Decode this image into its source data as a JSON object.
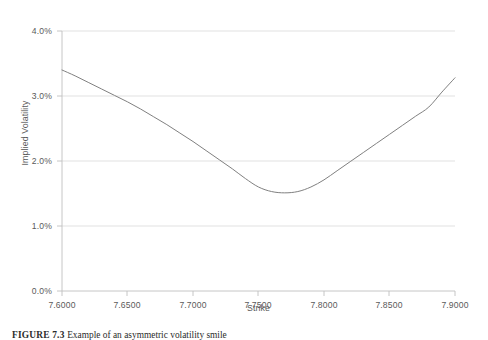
{
  "chart_data": {
    "type": "line",
    "title": "",
    "xlabel": "Strike",
    "ylabel": "Implied Volatility",
    "xlim": [
      7.6,
      7.9
    ],
    "ylim": [
      0.0,
      4.0
    ],
    "xtick_labels": [
      "7.6000",
      "7.6500",
      "7.7000",
      "7.7500",
      "7.8000",
      "7.8500",
      "7.9000"
    ],
    "xticks": [
      7.6,
      7.65,
      7.7,
      7.75,
      7.8,
      7.85,
      7.9
    ],
    "ytick_labels": [
      "0.0%",
      "1.0%",
      "2.0%",
      "3.0%",
      "4.0%"
    ],
    "yticks": [
      0.0,
      1.0,
      2.0,
      3.0,
      4.0
    ],
    "grid": "horizontal",
    "legend": "none",
    "series": [
      {
        "name": "Implied Volatility",
        "color": "#808080",
        "line_width": 1.0,
        "x": [
          7.6,
          7.61,
          7.62,
          7.63,
          7.64,
          7.65,
          7.66,
          7.67,
          7.68,
          7.69,
          7.7,
          7.71,
          7.72,
          7.73,
          7.74,
          7.75,
          7.76,
          7.77,
          7.78,
          7.79,
          7.8,
          7.81,
          7.82,
          7.83,
          7.84,
          7.85,
          7.86,
          7.87,
          7.88,
          7.89,
          7.9
        ],
        "y": [
          3.4,
          3.31,
          3.21,
          3.11,
          3.01,
          2.91,
          2.8,
          2.68,
          2.56,
          2.43,
          2.3,
          2.16,
          2.02,
          1.88,
          1.73,
          1.6,
          1.53,
          1.51,
          1.53,
          1.6,
          1.71,
          1.85,
          1.99,
          2.13,
          2.27,
          2.41,
          2.55,
          2.69,
          2.83,
          3.06,
          3.28
        ]
      }
    ],
    "annotations": {
      "minimum_strike": 7.7535,
      "minimum_volatility": 1.51
    }
  },
  "caption": {
    "label": "FIGURE 7.3",
    "text": "Example of an asymmetric volatility smile"
  }
}
